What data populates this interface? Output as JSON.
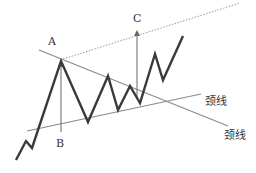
{
  "diagram": {
    "type": "symmetrical-triangle-breakout",
    "colors": {
      "price_line": "#3a3a3a",
      "trendline": "#8a8a8a",
      "arrow": "#666666",
      "dotted": "#9a9a9a",
      "text": "#333333"
    },
    "labels": {
      "a": "A",
      "b": "B",
      "c": "C",
      "neckline_upper": "颈线",
      "neckline_lower": "颈线"
    },
    "price_path": [
      [
        16,
        160
      ],
      [
        26,
        141
      ],
      [
        32,
        148
      ],
      [
        61,
        61
      ],
      [
        88,
        122
      ],
      [
        108,
        76
      ],
      [
        118,
        110
      ],
      [
        130,
        86
      ],
      [
        140,
        103
      ],
      [
        155,
        54
      ],
      [
        163,
        80
      ],
      [
        183,
        36
      ]
    ],
    "upper_trendline": [
      [
        39,
        50
      ],
      [
        228,
        126
      ]
    ],
    "lower_trendline": [
      [
        27,
        131
      ],
      [
        201,
        94
      ]
    ],
    "dotted_projection": [
      [
        63,
        59
      ],
      [
        240,
        3
      ]
    ],
    "arrow_ab": {
      "x": 61,
      "y_from": 132,
      "y_to": 64
    },
    "arrow_c": {
      "x": 137,
      "y_from": 97,
      "y_to": 33
    }
  }
}
